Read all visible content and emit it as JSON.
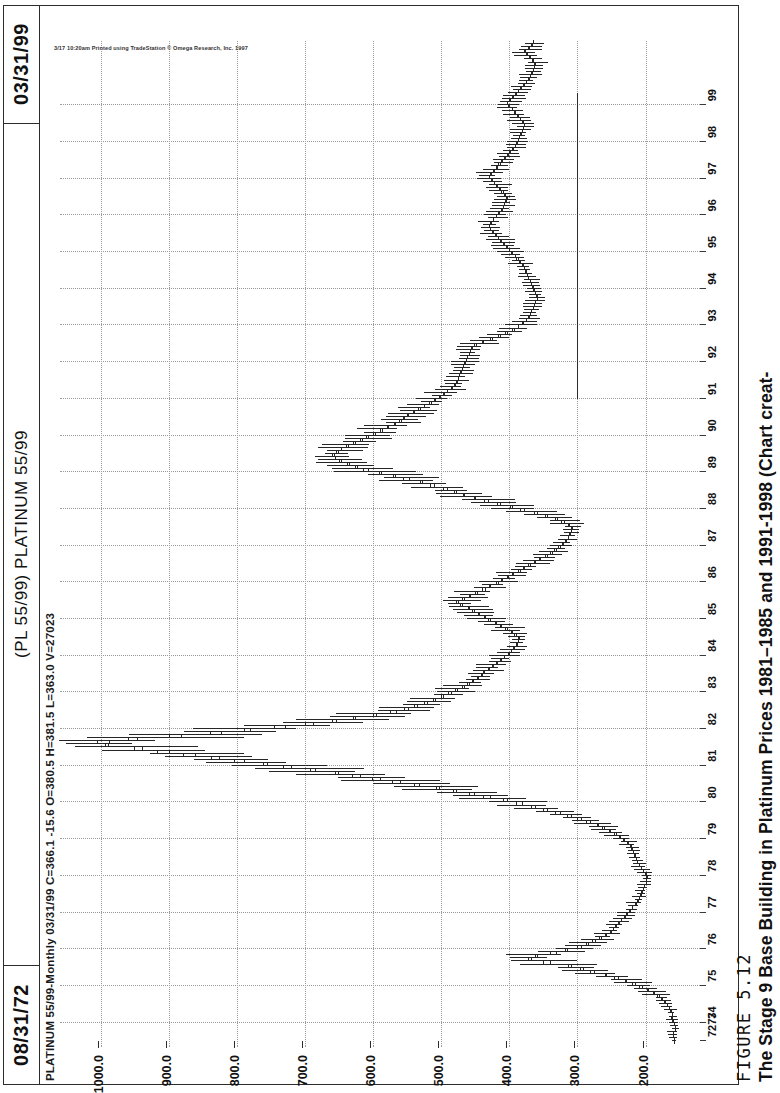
{
  "figure": {
    "number": "FIGURE 5.12",
    "caption": "The Stage 9 Base Building in Platinum Prices 1981–1985 and 1991-1998 (Chart creat-"
  },
  "header": {
    "date_start": "08/31/72",
    "date_end": "03/31/99",
    "title": "(PL 55/99) PLATINUM 55/99"
  },
  "quote_bar": {
    "text": "PLATINUM 55/99-Monthly  03/31/99  C=366.1  -15.6  O=380.5  H=381.5  L=363.0  V=27023",
    "symbol": "PLATINUM 55/99",
    "interval": "Monthly",
    "date": "03/31/99",
    "close": "C=366.1",
    "change": "-15.6",
    "open": "O=380.5",
    "high": "H=381.5",
    "low": "L=363.0",
    "volume": "V=27023"
  },
  "copyright": "3/17 10:20am Printed using TradeStation © Omega Research, Inc. 1997",
  "chart_data": {
    "type": "line",
    "title": "(PL 55/99) PLATINUM 55/99",
    "subtitle": "PLATINUM 55/99-Monthly",
    "xlabel": "",
    "ylabel": "",
    "orientation": "rotated-90-ccw",
    "grid": true,
    "legend": "none",
    "ylim": [
      150,
      1050
    ],
    "yticks": [
      1000.0,
      900.0,
      800.0,
      700.0,
      600.0,
      500.0,
      400.0,
      300.0,
      200.0
    ],
    "ytick_labels": [
      "1000.0",
      "900.0",
      "800.0",
      "700.0",
      "600.0",
      "500.0",
      "400.0",
      "300.0",
      "200.0"
    ],
    "xticks": [
      "7273",
      "74",
      "75",
      "76",
      "77",
      "78",
      "79",
      "80",
      "81",
      "82",
      "83",
      "84",
      "85",
      "86",
      "87",
      "88",
      "89",
      "90",
      "91",
      "92",
      "93",
      "94",
      "95",
      "96",
      "97",
      "98",
      "99"
    ],
    "annotations": [
      {
        "kind": "horizontal-support-line",
        "price": 300,
        "from_year": "91",
        "to_year": "99"
      }
    ],
    "x": [
      "1972",
      "1973",
      "1974",
      "1975",
      "1976",
      "1977",
      "1978",
      "1979",
      "1980",
      "1981",
      "1982",
      "1983",
      "1984",
      "1985",
      "1986",
      "1987",
      "1988",
      "1989",
      "1990",
      "1991",
      "1992",
      "1993",
      "1994",
      "1995",
      "1996",
      "1997",
      "1998",
      "1999"
    ],
    "series": [
      {
        "name": "Platinum monthly close",
        "values": [
          158,
          185,
          300,
          250,
          205,
          205,
          300,
          500,
          700,
          500,
          390,
          420,
          360,
          320,
          430,
          600,
          560,
          490,
          490,
          370,
          370,
          390,
          420,
          430,
          400,
          395,
          370,
          366
        ]
      },
      {
        "name": "Monthly high",
        "values": [
          170,
          210,
          380,
          285,
          225,
          225,
          340,
          760,
          1010,
          580,
          440,
          500,
          410,
          360,
          500,
          680,
          650,
          560,
          540,
          420,
          400,
          430,
          470,
          480,
          440,
          440,
          400,
          382
        ]
      },
      {
        "name": "Monthly low",
        "values": [
          150,
          165,
          240,
          215,
          190,
          190,
          260,
          420,
          580,
          420,
          340,
          370,
          320,
          280,
          370,
          520,
          470,
          440,
          430,
          330,
          340,
          355,
          380,
          395,
          365,
          355,
          335,
          363
        ]
      }
    ],
    "monthly_closes": [
      158,
      159,
      160,
      157,
      156,
      158,
      160,
      162,
      161,
      163,
      165,
      168,
      172,
      176,
      180,
      188,
      196,
      205,
      215,
      228,
      240,
      258,
      275,
      292,
      310,
      340,
      372,
      362,
      340,
      318,
      300,
      288,
      278,
      268,
      260,
      252,
      248,
      245,
      240,
      236,
      232,
      228,
      224,
      220,
      216,
      212,
      210,
      208,
      206,
      204,
      202,
      200,
      199,
      198,
      200,
      203,
      206,
      209,
      212,
      214,
      216,
      218,
      220,
      222,
      226,
      231,
      237,
      244,
      252,
      261,
      270,
      282,
      295,
      310,
      326,
      344,
      362,
      382,
      404,
      428,
      452,
      478,
      504,
      532,
      560,
      590,
      620,
      652,
      686,
      720,
      756,
      790,
      826,
      862,
      900,
      940,
      990,
      1005,
      960,
      900,
      840,
      790,
      745,
      700,
      660,
      630,
      600,
      575,
      555,
      540,
      525,
      512,
      500,
      490,
      480,
      470,
      462,
      455,
      448,
      442,
      438,
      432,
      426,
      420,
      414,
      408,
      402,
      398,
      394,
      390,
      388,
      386,
      390,
      396,
      404,
      412,
      420,
      428,
      436,
      444,
      452,
      460,
      470,
      478,
      470,
      460,
      450,
      440,
      430,
      420,
      412,
      404,
      396,
      388,
      380,
      372,
      364,
      356,
      348,
      340,
      334,
      328,
      322,
      318,
      314,
      312,
      310,
      308,
      312,
      320,
      330,
      344,
      360,
      378,
      396,
      414,
      432,
      450,
      466,
      478,
      492,
      510,
      528,
      548,
      568,
      588,
      608,
      624,
      636,
      648,
      656,
      660,
      655,
      648,
      640,
      630,
      620,
      610,
      600,
      590,
      580,
      570,
      562,
      556,
      550,
      542,
      534,
      526,
      518,
      510,
      504,
      498,
      492,
      486,
      482,
      478,
      476,
      474,
      472,
      470,
      468,
      466,
      464,
      462,
      460,
      458,
      456,
      452,
      440,
      428,
      416,
      406,
      396,
      388,
      382,
      376,
      372,
      370,
      368,
      366,
      364,
      362,
      360,
      360,
      362,
      364,
      366,
      368,
      370,
      372,
      374,
      376,
      378,
      380,
      384,
      388,
      392,
      396,
      400,
      404,
      408,
      412,
      416,
      420,
      424,
      428,
      430,
      428,
      424,
      420,
      416,
      412,
      410,
      408,
      406,
      404,
      406,
      410,
      414,
      418,
      422,
      426,
      430,
      428,
      424,
      420,
      416,
      412,
      408,
      404,
      400,
      396,
      392,
      390,
      388,
      386,
      384,
      382,
      380,
      378,
      380,
      384,
      388,
      392,
      396,
      400,
      404,
      400,
      396,
      392,
      388,
      384,
      380,
      376,
      372,
      370,
      368,
      366,
      364,
      362,
      366,
      370,
      374,
      378,
      372,
      368,
      366
    ]
  }
}
